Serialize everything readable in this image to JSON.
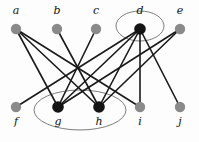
{
  "figure": {
    "background_color": "#fdfdfd",
    "edge_color": "#1a1a1a",
    "edge_width": 1.6,
    "group_outline_color": "#6e6e6e",
    "node_radius": 5.2,
    "label_font_size": 11
  },
  "chart_data": {
    "type": "diagram",
    "title": "",
    "nodes": [
      {
        "id": "a",
        "label": "a",
        "x": 16,
        "y": 29,
        "fill": "#8a8a8a",
        "label_x": 16,
        "label_y": 14,
        "highlighted": false
      },
      {
        "id": "b",
        "label": "b",
        "x": 57,
        "y": 29,
        "fill": "#8a8a8a",
        "label_x": 57,
        "label_y": 14,
        "highlighted": false
      },
      {
        "id": "c",
        "label": "c",
        "x": 96,
        "y": 29,
        "fill": "#8a8a8a",
        "label_x": 96,
        "label_y": 14,
        "highlighted": false
      },
      {
        "id": "d",
        "label": "d",
        "x": 140,
        "y": 29,
        "fill": "#141414",
        "label_x": 140,
        "label_y": 14,
        "highlighted": true
      },
      {
        "id": "e",
        "label": "e",
        "x": 180,
        "y": 29,
        "fill": "#8a8a8a",
        "label_x": 180,
        "label_y": 14,
        "highlighted": false
      },
      {
        "id": "f",
        "label": "f",
        "x": 16,
        "y": 107,
        "fill": "#8a8a8a",
        "label_x": 16,
        "label_y": 125,
        "highlighted": false
      },
      {
        "id": "g",
        "label": "g",
        "x": 58,
        "y": 107,
        "fill": "#141414",
        "label_x": 58,
        "label_y": 125,
        "highlighted": true
      },
      {
        "id": "h",
        "label": "h",
        "x": 99,
        "y": 107,
        "fill": "#141414",
        "label_x": 99,
        "label_y": 125,
        "highlighted": true
      },
      {
        "id": "i",
        "label": "i",
        "x": 140,
        "y": 107,
        "fill": "#8a8a8a",
        "label_x": 140,
        "label_y": 125,
        "highlighted": false
      },
      {
        "id": "j",
        "label": "j",
        "x": 180,
        "y": 107,
        "fill": "#8a8a8a",
        "label_x": 180,
        "label_y": 125,
        "highlighted": false
      }
    ],
    "edges": [
      {
        "source": "a",
        "target": "g"
      },
      {
        "source": "a",
        "target": "h"
      },
      {
        "source": "a",
        "target": "i"
      },
      {
        "source": "b",
        "target": "h"
      },
      {
        "source": "c",
        "target": "g"
      },
      {
        "source": "d",
        "target": "f"
      },
      {
        "source": "d",
        "target": "g"
      },
      {
        "source": "d",
        "target": "h"
      },
      {
        "source": "d",
        "target": "i"
      },
      {
        "source": "d",
        "target": "j"
      },
      {
        "source": "e",
        "target": "g"
      },
      {
        "source": "e",
        "target": "h"
      }
    ],
    "groups": [
      {
        "id": "group-d",
        "label": "",
        "members": [
          "d"
        ],
        "cx": 140,
        "cy": 26,
        "rx": 24,
        "ry": 15
      },
      {
        "id": "group-gh",
        "label": "",
        "members": [
          "g",
          "h"
        ],
        "cx": 80,
        "cy": 110,
        "rx": 46,
        "ry": 20
      }
    ]
  }
}
